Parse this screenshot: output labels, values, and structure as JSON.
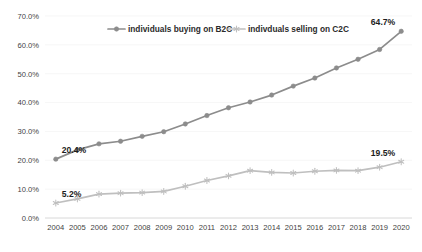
{
  "chart_data": {
    "type": "line",
    "title": "",
    "xlabel": "",
    "ylabel": "",
    "ylim": [
      0,
      70
    ],
    "ytick_labels": [
      "0.0%",
      "10.0%",
      "20.0%",
      "30.0%",
      "40.0%",
      "50.0%",
      "60.0%",
      "70.0%"
    ],
    "ytick_values": [
      0,
      10,
      20,
      30,
      40,
      50,
      60,
      70
    ],
    "grid": false,
    "legend_position": "top-center",
    "categories": [
      "2004",
      "2005",
      "2006",
      "2007",
      "2008",
      "2009",
      "2010",
      "2011",
      "2012",
      "2013",
      "2014",
      "2015",
      "2016",
      "2017",
      "2018",
      "2019",
      "2020"
    ],
    "series": [
      {
        "name": "individuals buying on B2C",
        "color": "#8c8c8c",
        "marker": "circle",
        "values": [
          20.4,
          23.6,
          25.7,
          26.6,
          28.3,
          29.9,
          32.6,
          35.5,
          38.2,
          40.2,
          42.6,
          45.7,
          48.5,
          52.0,
          55.0,
          58.4,
          64.7
        ]
      },
      {
        "name": "indivduals selling on C2C",
        "color": "#bfbfbf",
        "marker": "asterisk",
        "values": [
          5.2,
          6.6,
          8.3,
          8.6,
          8.8,
          9.2,
          11.0,
          13.0,
          14.6,
          16.4,
          15.8,
          15.6,
          16.2,
          16.5,
          16.4,
          17.6,
          19.5
        ]
      }
    ],
    "data_labels": [
      {
        "series": "individuals buying on B2C",
        "category": "2004",
        "text": "20.4%"
      },
      {
        "series": "individuals buying on B2C",
        "category": "2020",
        "text": "64.7%"
      },
      {
        "series": "indivduals selling on C2C",
        "category": "2004",
        "text": "5.2%"
      },
      {
        "series": "indivduals selling on C2C",
        "category": "2020",
        "text": "19.5%"
      }
    ]
  },
  "legend": {
    "items": [
      {
        "label": "individuals buying on B2C",
        "color": "#8c8c8c",
        "marker": "circle"
      },
      {
        "label": "indivduals selling on C2C",
        "color": "#bfbfbf",
        "marker": "asterisk"
      }
    ]
  }
}
